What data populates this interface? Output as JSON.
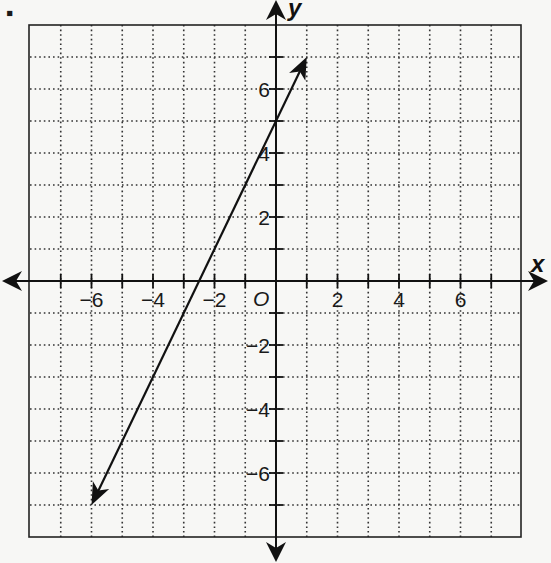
{
  "bullet": "▪",
  "chart_data": {
    "type": "line",
    "title": "",
    "xlabel": "x",
    "ylabel": "y",
    "origin_label": "O",
    "xlim": [
      -8,
      8
    ],
    "ylim": [
      -8,
      8
    ],
    "grid": true,
    "grid_style": "dotted",
    "x_ticks": [
      -6,
      -4,
      -2,
      2,
      4,
      6
    ],
    "x_tick_labels": [
      "−6",
      "−4",
      "−2",
      "2",
      "4",
      "6"
    ],
    "y_ticks": [
      6,
      4,
      2,
      -2,
      -4,
      -6
    ],
    "y_tick_labels": [
      "6",
      "4",
      "2",
      "−2",
      "−4",
      "−6"
    ],
    "series": [
      {
        "name": "line",
        "equation": "y = 2x + 5",
        "x": [
          -6,
          1
        ],
        "y": [
          -7,
          7
        ],
        "arrows_both_ends": true
      }
    ]
  },
  "colors": {
    "ink": "#111111",
    "grid": "#333333",
    "paper": "#f7f7f5"
  }
}
